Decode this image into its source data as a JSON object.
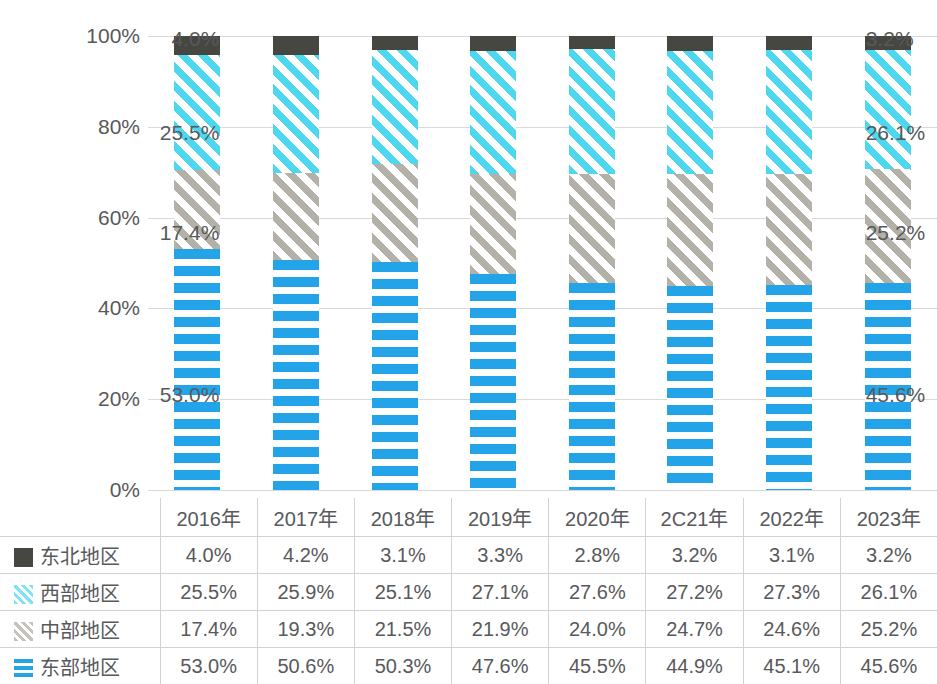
{
  "chart_data": {
    "type": "bar",
    "subtype": "stacked-100-percent",
    "title": "",
    "xlabel": "",
    "ylabel": "",
    "ylim": [
      0,
      100
    ],
    "ytick_labels": [
      "100%",
      "80%",
      "60%",
      "40%",
      "20%",
      "0%"
    ],
    "ytick_values": [
      100,
      80,
      60,
      40,
      20,
      0
    ],
    "grid": true,
    "legend_position": "table-row-headers",
    "categories": [
      "2016年",
      "2017年",
      "2018年",
      "2019年",
      "2020年",
      "2C21年",
      "2022年",
      "2023年"
    ],
    "series": [
      {
        "name": "东部地区",
        "swatch": "blue-horizontal-lines",
        "color": "#23a4e8",
        "values": [
          53.0,
          50.6,
          50.3,
          47.6,
          45.5,
          44.9,
          45.1,
          45.6
        ],
        "labels": [
          "53.0%",
          "50.6%",
          "50.3%",
          "47.6%",
          "45.5%",
          "44.9%",
          "45.1%",
          "45.6%"
        ]
      },
      {
        "name": "中部地区",
        "swatch": "gray-diagonal-hatch",
        "color": "#b3b1a8",
        "values": [
          17.4,
          19.3,
          21.5,
          21.9,
          24.0,
          24.7,
          24.6,
          25.2
        ],
        "labels": [
          "17.4%",
          "19.3%",
          "21.5%",
          "21.9%",
          "24.0%",
          "24.7%",
          "24.6%",
          "25.2%"
        ]
      },
      {
        "name": "西部地区",
        "swatch": "cyan-diagonal-hatch",
        "color": "#4ed8ef",
        "values": [
          25.5,
          25.9,
          25.1,
          27.1,
          27.6,
          27.2,
          27.3,
          26.1
        ],
        "labels": [
          "25.5%",
          "25.9%",
          "25.1%",
          "27.1%",
          "27.6%",
          "27.2%",
          "27.3%",
          "26.1%"
        ]
      },
      {
        "name": "东北地区",
        "swatch": "dark-solid-square",
        "color": "#474742",
        "values": [
          4.0,
          4.2,
          3.1,
          3.3,
          2.8,
          3.2,
          3.1,
          3.2
        ],
        "labels": [
          "4.0%",
          "4.2%",
          "3.1%",
          "3.3%",
          "2.8%",
          "3.2%",
          "3.1%",
          "3.2%"
        ]
      }
    ],
    "annotations": [
      {
        "text": "4.0%",
        "series": "东北地区",
        "category": "2016年",
        "side": "left"
      },
      {
        "text": "25.5%",
        "series": "西部地区",
        "category": "2016年",
        "side": "left"
      },
      {
        "text": "17.4%",
        "series": "中部地区",
        "category": "2016年",
        "side": "left"
      },
      {
        "text": "53.0%",
        "series": "东部地区",
        "category": "2016年",
        "side": "left"
      },
      {
        "text": "3.2%",
        "series": "东北地区",
        "category": "2023年",
        "side": "right"
      },
      {
        "text": "26.1%",
        "series": "西部地区",
        "category": "2023年",
        "side": "right"
      },
      {
        "text": "25.2%",
        "series": "中部地区",
        "category": "2023年",
        "side": "right"
      },
      {
        "text": "45.6%",
        "series": "东部地区",
        "category": "2023年",
        "side": "right"
      }
    ]
  },
  "table": {
    "corner_label": "",
    "columns": [
      "2016年",
      "2017年",
      "2018年",
      "2019年",
      "2020年",
      "2C21年",
      "2022年",
      "2023年"
    ],
    "rows": [
      {
        "label": "东北地区",
        "swatch": "dark-solid-square",
        "values": [
          "4.0%",
          "4.2%",
          "3.1%",
          "3.3%",
          "2.8%",
          "3.2%",
          "3.1%",
          "3.2%"
        ]
      },
      {
        "label": "西部地区",
        "swatch": "cyan-diagonal-hatch",
        "values": [
          "25.5%",
          "25.9%",
          "25.1%",
          "27.1%",
          "27.6%",
          "27.2%",
          "27.3%",
          "26.1%"
        ]
      },
      {
        "label": "中部地区",
        "swatch": "gray-diagonal-hatch",
        "values": [
          "17.4%",
          "19.3%",
          "21.5%",
          "21.9%",
          "24.0%",
          "24.7%",
          "24.6%",
          "25.2%"
        ]
      },
      {
        "label": "东部地区",
        "swatch": "blue-horizontal-lines",
        "values": [
          "53.0%",
          "50.6%",
          "50.3%",
          "47.6%",
          "45.5%",
          "44.9%",
          "45.1%",
          "45.6%"
        ]
      }
    ]
  },
  "axis": {
    "ticks": [
      "100%",
      "80%",
      "60%",
      "40%",
      "20%",
      "0%"
    ]
  }
}
